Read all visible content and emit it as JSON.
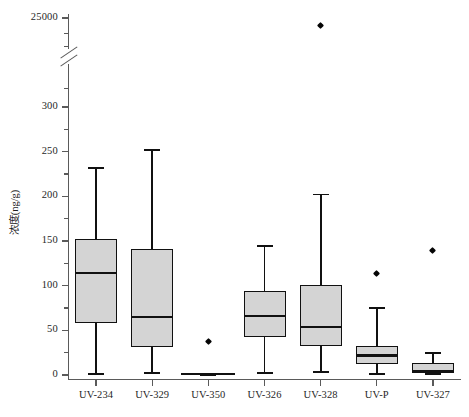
{
  "chart_data": {
    "type": "box",
    "title": "",
    "xlabel": "",
    "ylabel": "浓度(ng/g)",
    "categories": [
      "UV-234",
      "UV-329",
      "UV-350",
      "UV-326",
      "UV-328",
      "UV-P",
      "UV-327"
    ],
    "ytick_labels": [
      "0",
      "50",
      "100",
      "150",
      "200",
      "250",
      "300",
      "25000"
    ],
    "ytick_values": [
      0,
      50,
      100,
      150,
      200,
      250,
      300,
      25000
    ],
    "yminor_ticks": [
      25,
      75,
      125,
      175,
      225,
      275
    ],
    "ylim": [
      0,
      300
    ],
    "axis_break": true,
    "axis_break_note": "y-axis broken between 300 and 25000",
    "grid": false,
    "legend": "none",
    "boxes": [
      {
        "category": "UV-234",
        "whisker_low": 2,
        "q1": 58,
        "median": 114,
        "q3": 152,
        "whisker_high": 233,
        "outliers": []
      },
      {
        "category": "UV-329",
        "whisker_low": 3,
        "q1": 31,
        "median": 65,
        "q3": 141,
        "whisker_high": 253,
        "outliers": []
      },
      {
        "category": "UV-350",
        "whisker_low": 1,
        "q1": 1,
        "median": 1,
        "q3": 1,
        "whisker_high": 1,
        "outliers": [
          38
        ]
      },
      {
        "category": "UV-326",
        "whisker_low": 3,
        "q1": 42,
        "median": 66,
        "q3": 94,
        "whisker_high": 145,
        "outliers": []
      },
      {
        "category": "UV-328",
        "whisker_low": 4,
        "q1": 32,
        "median": 54,
        "q3": 101,
        "whisker_high": 203,
        "outliers": [
          24800
        ]
      },
      {
        "category": "UV-P",
        "whisker_low": 2,
        "q1": 12,
        "median": 22,
        "q3": 33,
        "whisker_high": 76,
        "outliers": [
          114
        ]
      },
      {
        "category": "UV-327",
        "whisker_low": 2,
        "q1": 2,
        "median": 5,
        "q3": 13,
        "whisker_high": 26,
        "outliers": [
          139
        ]
      }
    ],
    "colors": {
      "box_fill": "#d4d4d4",
      "box_line": "#111111",
      "axis": "#5a5a5a",
      "background": "#ffffff"
    }
  }
}
